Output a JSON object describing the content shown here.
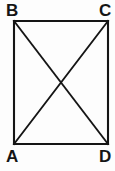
{
  "figure": {
    "name": "rectangle-with-diagonals",
    "shape": "rectangle",
    "background_color": "#fdfdfd",
    "stroke_color": "#151515",
    "stroke_width": 2.1,
    "diagonal_stroke_width": 1.9,
    "vertices": [
      {
        "id": "B",
        "label": "B",
        "role": "top-left",
        "x": 14,
        "y": 21,
        "label_x": 6,
        "label_y": 2
      },
      {
        "id": "C",
        "label": "C",
        "role": "top-right",
        "x": 108,
        "y": 21,
        "label_x": 99,
        "label_y": 2
      },
      {
        "id": "D",
        "label": "D",
        "role": "bottom-right",
        "x": 108,
        "y": 144,
        "label_x": 99,
        "label_y": 148
      },
      {
        "id": "A",
        "label": "A",
        "role": "bottom-left",
        "x": 14,
        "y": 144,
        "label_x": 6,
        "label_y": 148
      }
    ],
    "sides": [
      {
        "name": "BC",
        "from": "B",
        "to": "C"
      },
      {
        "name": "CD",
        "from": "C",
        "to": "D"
      },
      {
        "name": "DA",
        "from": "D",
        "to": "A"
      },
      {
        "name": "AB",
        "from": "A",
        "to": "B"
      }
    ],
    "diagonals": [
      {
        "name": "BD",
        "from": "B",
        "to": "D"
      },
      {
        "name": "AC",
        "from": "A",
        "to": "C"
      }
    ],
    "intersection": {
      "name": "diagonal-intersection",
      "x": 61,
      "y": 82.5
    }
  }
}
